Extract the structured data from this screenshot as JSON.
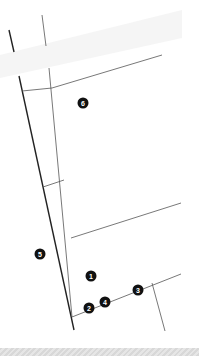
{
  "map": {
    "colors": {
      "background": "#ffffff",
      "line": "#333333",
      "marker_fill": "#111111",
      "marker_text": "#ffffff",
      "bottom_bar": "#dcdcdc"
    },
    "markers": [
      {
        "label": "6",
        "x": 83,
        "y": 103
      },
      {
        "label": "5",
        "x": 40,
        "y": 254
      },
      {
        "label": "1",
        "x": 91,
        "y": 276
      },
      {
        "label": "2",
        "x": 89,
        "y": 308
      },
      {
        "label": "4",
        "x": 105,
        "y": 302
      },
      {
        "label": "3",
        "x": 138,
        "y": 290
      }
    ]
  }
}
